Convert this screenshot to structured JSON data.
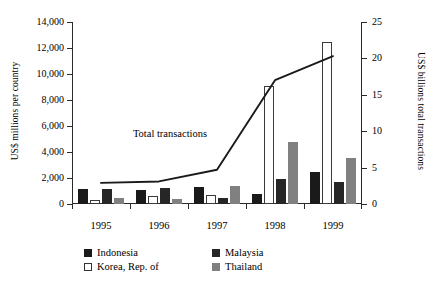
{
  "chart_data": {
    "type": "bar",
    "title": "",
    "categories": [
      "1995",
      "1996",
      "1997",
      "1998",
      "1999"
    ],
    "xlabel": "",
    "ylabel": "US$ millions per country",
    "ylabel_right": "US$ billions total transactions",
    "ylim": [
      0,
      14000
    ],
    "ylim_right": [
      0,
      25
    ],
    "yticks": [
      "0",
      "2,000",
      "4,000",
      "6,000",
      "8,000",
      "10,000",
      "12,000",
      "14,000"
    ],
    "ytick_values": [
      0,
      2000,
      4000,
      6000,
      8000,
      10000,
      12000,
      14000
    ],
    "yticks_right": [
      "0",
      "5",
      "10",
      "15",
      "20",
      "25"
    ],
    "ytick_values_right": [
      0,
      5,
      10,
      15,
      20,
      25
    ],
    "grid": false,
    "legend_position": "bottom",
    "series": [
      {
        "name": "Indonesia",
        "color": "#1a1a1a",
        "values": [
          1150,
          1080,
          1300,
          800,
          2450
        ]
      },
      {
        "name": "Korea, Rep. of",
        "color": "#ffffff",
        "values": [
          300,
          650,
          700,
          9100,
          12500
        ]
      },
      {
        "name": "Malaysia",
        "color": "#262626",
        "values": [
          1150,
          1200,
          480,
          1900,
          1700
        ]
      },
      {
        "name": "Thailand",
        "color": "#808080",
        "values": [
          480,
          350,
          1380,
          4800,
          3550
        ]
      }
    ],
    "line_series": {
      "name": "Total transactions",
      "color": "#1a1a1a",
      "axis": "right",
      "x": [
        "1995",
        "1996",
        "1997",
        "1998",
        "1999"
      ],
      "values": [
        2.9,
        3.1,
        4.7,
        17.0,
        20.3
      ]
    },
    "annotations": [
      {
        "text": "Total transactions",
        "x": 1996,
        "y": 5400
      }
    ]
  },
  "legend": {
    "items": [
      {
        "label": "Indonesia"
      },
      {
        "label": "Malaysia"
      },
      {
        "label": "Korea, Rep. of"
      },
      {
        "label": "Thailand"
      }
    ]
  }
}
